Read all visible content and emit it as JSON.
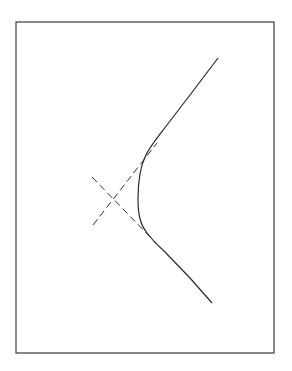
{
  "figure": {
    "frame": {
      "x": 16,
      "y": 22,
      "width": 258,
      "height": 331
    },
    "colors": {
      "line": "#2a2a2a",
      "frame": "#3a3a3a",
      "background": "#ffffff"
    },
    "asymptotes": [
      {
        "x1": 93,
        "y1": 225,
        "x2": 157,
        "y2": 143,
        "style": "dashed"
      },
      {
        "x1": 92,
        "y1": 177,
        "x2": 156,
        "y2": 243,
        "style": "dashed"
      }
    ],
    "asymptote_intersection": {
      "x": 113,
      "y": 199
    },
    "hyperbola_branch": {
      "vertex": {
        "x": 138,
        "y": 199
      },
      "upper_end": {
        "x": 218,
        "y": 58
      },
      "lower_end": {
        "x": 212,
        "y": 303
      },
      "path": "M218,58 L190,95 L167,125 C158,137 150,146 145,157 C140,168 138,183 138,199 C138,214 140,224 147,233 C153,241 158,246 165,252 L190,278 L212,303"
    }
  }
}
